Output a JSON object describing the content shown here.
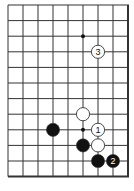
{
  "diagram": {
    "type": "go-board-fragment",
    "colors": {
      "background": "#ffffff",
      "line": "#333333",
      "black_stone": "#111111",
      "white_stone": "#ffffff"
    },
    "grid": {
      "columns": 9,
      "rows": 12,
      "origin_x": 8,
      "origin_y": 5,
      "spacing_x": 15.0,
      "spacing_y": 15.6,
      "edges": {
        "top": "open",
        "left": "open",
        "right": "board-edge",
        "bottom": "board-edge"
      }
    },
    "star_points": [
      {
        "col": 5,
        "row": 2
      },
      {
        "col": 5,
        "row": 8
      }
    ],
    "stones": [
      {
        "color": "white",
        "col": 6,
        "row": 3,
        "label": "3"
      },
      {
        "color": "white",
        "col": 5,
        "row": 7,
        "label": ""
      },
      {
        "color": "black",
        "col": 3,
        "row": 8,
        "label": ""
      },
      {
        "color": "white",
        "col": 6,
        "row": 8,
        "label": "1"
      },
      {
        "color": "black",
        "col": 5,
        "row": 9,
        "label": ""
      },
      {
        "color": "white",
        "col": 6,
        "row": 9,
        "label": ""
      },
      {
        "color": "black",
        "col": 6,
        "row": 10,
        "label": ""
      },
      {
        "color": "black",
        "col": 7,
        "row": 10,
        "label": "2"
      }
    ],
    "caption": ""
  }
}
